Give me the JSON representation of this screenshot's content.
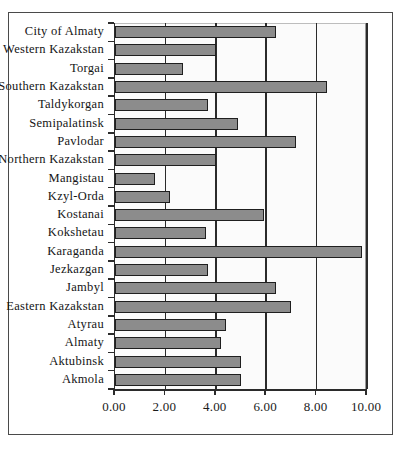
{
  "chart_data": {
    "type": "bar",
    "orientation": "horizontal",
    "title": "",
    "xlabel": "",
    "ylabel": "",
    "xlim": [
      0.0,
      10.0
    ],
    "xticks": [
      "0.00",
      "2.00",
      "4.00",
      "6.00",
      "8.00",
      "10.00"
    ],
    "xtick_values": [
      0,
      2,
      4,
      6,
      8,
      10
    ],
    "grid": true,
    "legend": "none",
    "categories": [
      "City of Almaty",
      "Western Kazakstan",
      "Torgai",
      "Southern Kazakstan",
      "Taldykorgan",
      "Semipalatinsk",
      "Pavlodar",
      "Northern Kazakstan",
      "Mangistau",
      "Kzyl-Orda",
      "Kostanai",
      "Kokshetau",
      "Karaganda",
      "Jezkazgan",
      "Jambyl",
      "Eastern Kazakstan",
      "Atyrau",
      "Almaty",
      "Aktubinsk",
      "Akmola"
    ],
    "values": [
      6.4,
      4.0,
      2.7,
      8.4,
      3.7,
      4.9,
      7.2,
      4.0,
      1.6,
      2.2,
      5.9,
      3.6,
      9.8,
      3.7,
      6.4,
      7.0,
      4.4,
      4.2,
      5.0,
      5.0
    ],
    "bar_color": "#8c8c8c",
    "bar_edge_color": "#1f1f1f",
    "plot_background": "#fbfbfb",
    "axis_color": "#2b2b2b",
    "frame_color": "#4a4a4a"
  }
}
